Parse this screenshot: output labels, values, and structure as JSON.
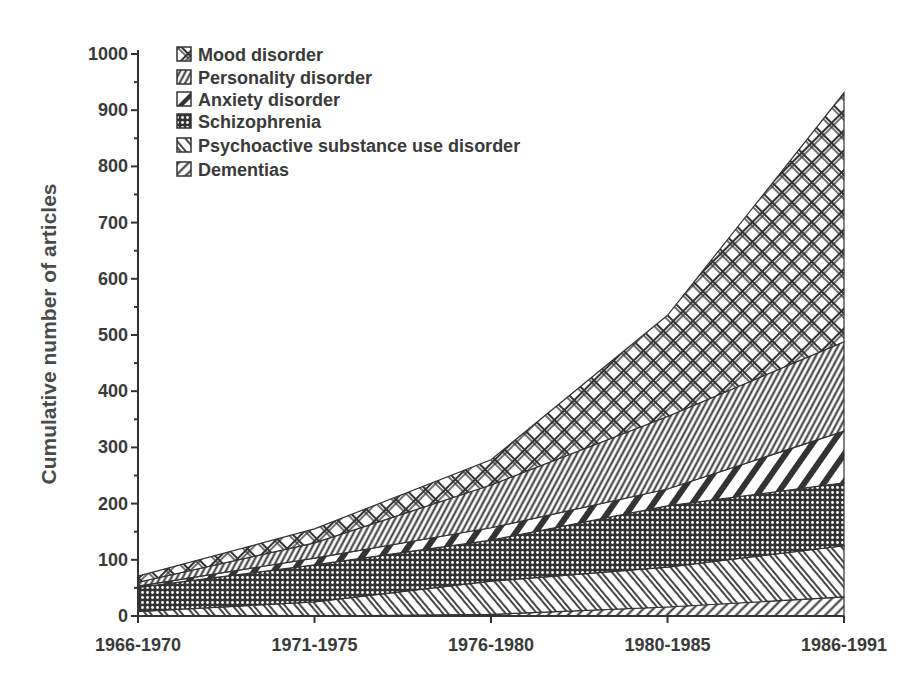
{
  "chart_data": {
    "type": "area",
    "stacked": true,
    "title": "",
    "xlabel": "",
    "ylabel": "Cumulative number of articles",
    "ylim": [
      0,
      1000
    ],
    "yticks": [
      0,
      100,
      200,
      300,
      400,
      500,
      600,
      700,
      800,
      900,
      1000
    ],
    "grid": false,
    "legend_position": "upper-left-inside",
    "categories": [
      "1966-1970",
      "1971-1975",
      "1976-1980",
      "1980-1985",
      "1986-1991"
    ],
    "series": [
      {
        "name": "Dementias",
        "pattern": "diagonal-forward-wide",
        "values": [
          0,
          0,
          3,
          16,
          34
        ]
      },
      {
        "name": "Psychoactive substance use disorder",
        "pattern": "diagonal-backward",
        "values": [
          8,
          25,
          59,
          71,
          91
        ]
      },
      {
        "name": "Schizophrenia",
        "pattern": "dense-checker",
        "values": [
          43,
          66,
          73,
          109,
          112
        ]
      },
      {
        "name": "Anxiety disorder",
        "pattern": "thick-diagonal",
        "values": [
          2,
          12,
          22,
          30,
          92
        ]
      },
      {
        "name": "Personality disorder",
        "pattern": "fine-diagonal",
        "values": [
          7,
          27,
          76,
          129,
          159
        ]
      },
      {
        "name": "Mood disorder",
        "pattern": "crosshatch",
        "values": [
          11,
          25,
          45,
          180,
          443
        ]
      }
    ],
    "cumulative_totals": [
      71,
      155,
      278,
      535,
      931
    ]
  },
  "legend": {
    "items": [
      {
        "label": "Mood disorder",
        "pattern": "crosshatch"
      },
      {
        "label": "Personality disorder",
        "pattern": "fine-diagonal"
      },
      {
        "label": "Anxiety disorder",
        "pattern": "half-filled"
      },
      {
        "label": "Schizophrenia",
        "pattern": "dense-checker"
      },
      {
        "label": "Psychoactive substance use disorder",
        "pattern": "diagonal-backward"
      },
      {
        "label": "Dementias",
        "pattern": "diagonal-forward-wide"
      }
    ]
  },
  "colors": {
    "ink": "#333333",
    "text": "#3a3a3a",
    "background": "#ffffff"
  }
}
